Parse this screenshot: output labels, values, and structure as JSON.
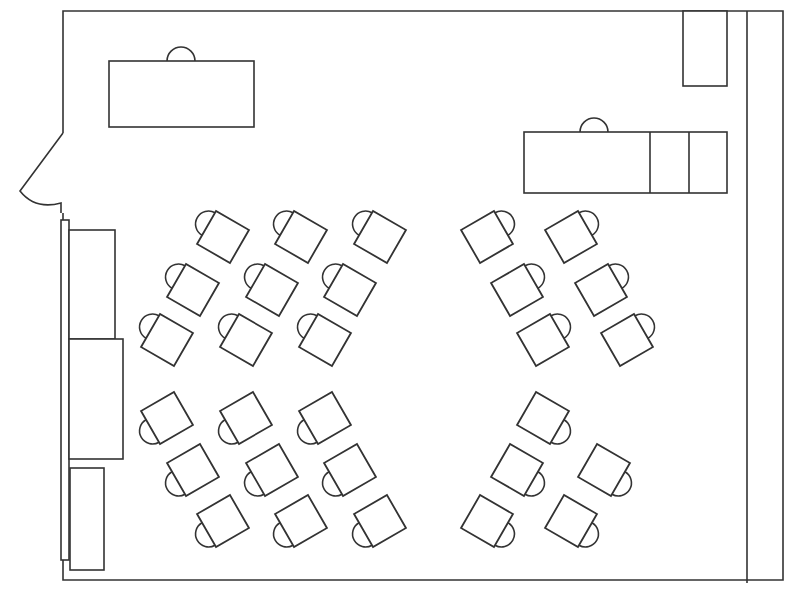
{
  "diagram": {
    "type": "floor-plan",
    "colors": {
      "stroke": "#333333",
      "background": "#ffffff"
    },
    "furniture": {
      "teacher_desk": {
        "label": "",
        "has_chair": true
      },
      "front_counter": {
        "label": "",
        "has_chair": true,
        "sections": 3
      },
      "corner_cabinet": {
        "label": ""
      },
      "left_wall_cabinets": {
        "label": "",
        "count": 3
      },
      "door": {
        "label": "",
        "swing": "outward"
      }
    },
    "student_desks": {
      "total": 29,
      "groups": [
        {
          "name": "top-left",
          "count": 9,
          "rows": 3,
          "per_row": 3,
          "chair_side": "upper-left"
        },
        {
          "name": "bottom-left",
          "count": 9,
          "rows": 3,
          "per_row": 3,
          "chair_side": "lower-left"
        },
        {
          "name": "top-right",
          "count": 6,
          "rows": 3,
          "per_row": 2,
          "chair_side": "upper-right"
        },
        {
          "name": "bottom-right",
          "count": 5,
          "rows": 3,
          "per_row": [
            1,
            2,
            2
          ],
          "chair_side": "lower-right"
        }
      ]
    }
  }
}
